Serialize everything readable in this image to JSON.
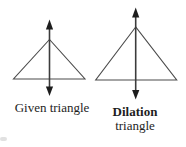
{
  "colors": {
    "background": "#ffffff",
    "triangle_stroke": "#4b4b4b",
    "axis_stroke": "#3c3c3c",
    "arrowhead_fill": "#1d1d1d",
    "text": "#1e1e1e"
  },
  "given_triangle": {
    "label": "Given triangle",
    "outline_points": "49.5,39.5 13.5,79 85,79",
    "axis_path": "M 49.5 26.5 L 49.5 90",
    "arrowhead_up_points": "49.5,19.5 45.9,29.5 53.1,29.5",
    "arrowhead_down_points": "49.5,96 45.9,86.5 53.1,86.5"
  },
  "dilation_triangle": {
    "label_bold": "Dilation",
    "label_regular": "triangle",
    "outline_points": "135.7,27 95.7,80 176.7,80",
    "axis_path": "M 135.7 14 L 135.7 92.5",
    "arrowhead_up_points": "135.7,7.5 132.1,17.5 139.3,17.5",
    "arrowhead_down_points": "135.7,99.5 132.1,90 139.3,90"
  }
}
